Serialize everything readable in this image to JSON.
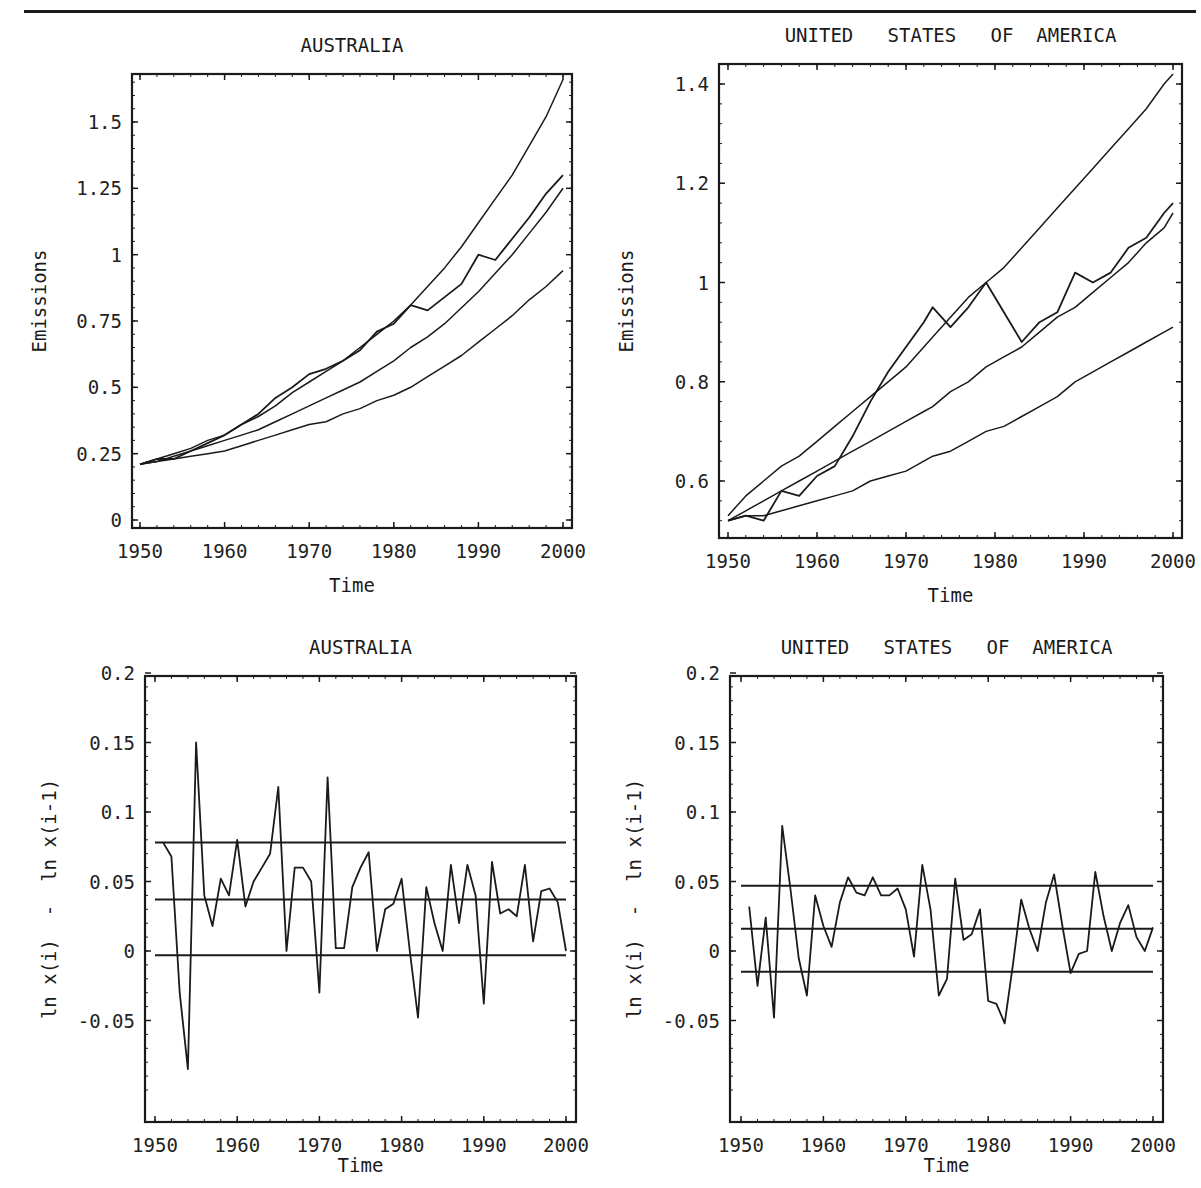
{
  "page": {
    "header_rule": true
  },
  "panels": [
    {
      "id": "aus-emissions",
      "title": "AUSTRALIA",
      "xlabel": "Time",
      "ylabel": "Emissions",
      "frame": {
        "left": 132,
        "top": 74,
        "right": 572,
        "bottom": 528
      },
      "xmap": {
        "x0": 1950,
        "px0": 140,
        "x1": 2000,
        "px1": 563
      },
      "ymap": {
        "y0": 0,
        "py0": 520,
        "y1": 1.5,
        "py1": 122
      },
      "yticks": [
        {
          "v": 0,
          "label": "0"
        },
        {
          "v": 0.25,
          "label": "0.25"
        },
        {
          "v": 0.5,
          "label": "0.5"
        },
        {
          "v": 0.75,
          "label": "0.75"
        },
        {
          "v": 1,
          "label": "1"
        },
        {
          "v": 1.25,
          "label": "1.25"
        },
        {
          "v": 1.5,
          "label": "1.5"
        }
      ],
      "xticks": [
        {
          "v": 1950,
          "label": "1950"
        },
        {
          "v": 1960,
          "label": "1960"
        },
        {
          "v": 1970,
          "label": "1970"
        },
        {
          "v": 1980,
          "label": "1980"
        },
        {
          "v": 1990,
          "label": "1990"
        },
        {
          "v": 2000,
          "label": "2000"
        }
      ]
    },
    {
      "id": "usa-emissions",
      "title": "UNITED   STATES   OF  AMERICA",
      "xlabel": "Time",
      "ylabel": "Emissions",
      "frame": {
        "left": 719,
        "top": 64,
        "right": 1182,
        "bottom": 538
      },
      "xmap": {
        "x0": 1950,
        "px0": 728,
        "x1": 2000,
        "px1": 1173
      },
      "ymap": {
        "y0": 0.6,
        "py0": 481,
        "y1": 1.4,
        "py1": 84
      },
      "yticks": [
        {
          "v": 0.6,
          "label": "0.6"
        },
        {
          "v": 0.8,
          "label": "0.8"
        },
        {
          "v": 1.0,
          "label": "1"
        },
        {
          "v": 1.2,
          "label": "1.2"
        },
        {
          "v": 1.4,
          "label": "1.4"
        }
      ],
      "xticks": [
        {
          "v": 1950,
          "label": "1950"
        },
        {
          "v": 1960,
          "label": "1960"
        },
        {
          "v": 1970,
          "label": "1970"
        },
        {
          "v": 1980,
          "label": "1980"
        },
        {
          "v": 1990,
          "label": "1990"
        },
        {
          "v": 2000,
          "label": "2000"
        }
      ]
    },
    {
      "id": "aus-growth",
      "title": "AUSTRALIA",
      "xlabel": "Time",
      "ylabel": "ln x(i)  -  ln x(i-1)",
      "frame": {
        "left": 145,
        "top": 676,
        "right": 576,
        "bottom": 1122
      },
      "xmap": {
        "x0": 1950,
        "px0": 155,
        "x1": 2000,
        "px1": 566
      },
      "ymap": {
        "y0": 0,
        "py0": 951,
        "y1": 0.2,
        "py1": 673
      },
      "yticks": [
        {
          "v": -0.05,
          "label": "-0.05"
        },
        {
          "v": 0,
          "label": "0"
        },
        {
          "v": 0.05,
          "label": "0.05"
        },
        {
          "v": 0.1,
          "label": "0.1"
        },
        {
          "v": 0.15,
          "label": "0.15"
        },
        {
          "v": 0.2,
          "label": "0.2"
        }
      ],
      "xticks": [
        {
          "v": 1950,
          "label": "1950"
        },
        {
          "v": 1960,
          "label": "1960"
        },
        {
          "v": 1970,
          "label": "1970"
        },
        {
          "v": 1980,
          "label": "1980"
        },
        {
          "v": 1990,
          "label": "1990"
        },
        {
          "v": 2000,
          "label": "2000"
        }
      ]
    },
    {
      "id": "usa-growth",
      "title": "UNITED   STATES   OF  AMERICA",
      "xlabel": "Time",
      "ylabel": "ln x(i)  -  ln x(i-1)",
      "frame": {
        "left": 730,
        "top": 676,
        "right": 1163,
        "bottom": 1122
      },
      "xmap": {
        "x0": 1950,
        "px0": 741,
        "x1": 2000,
        "px1": 1153
      },
      "ymap": {
        "y0": 0,
        "py0": 951,
        "y1": 0.2,
        "py1": 673
      },
      "yticks": [
        {
          "v": -0.05,
          "label": "-0.05"
        },
        {
          "v": 0,
          "label": "0"
        },
        {
          "v": 0.05,
          "label": "0.05"
        },
        {
          "v": 0.1,
          "label": "0.1"
        },
        {
          "v": 0.15,
          "label": "0.15"
        },
        {
          "v": 0.2,
          "label": "0.2"
        }
      ],
      "xticks": [
        {
          "v": 1950,
          "label": "1950"
        },
        {
          "v": 1960,
          "label": "1960"
        },
        {
          "v": 1970,
          "label": "1970"
        },
        {
          "v": 1980,
          "label": "1980"
        },
        {
          "v": 1990,
          "label": "1990"
        },
        {
          "v": 2000,
          "label": "2000"
        }
      ]
    }
  ],
  "chart_data": [
    {
      "type": "line",
      "title": "AUSTRALIA",
      "xlabel": "Time",
      "ylabel": "Emissions",
      "xlim": [
        1950,
        2000
      ],
      "ylim": [
        -0.02,
        1.7
      ],
      "grid": false,
      "legend": null,
      "x": [
        1950,
        1952,
        1954,
        1956,
        1958,
        1960,
        1962,
        1964,
        1966,
        1968,
        1970,
        1972,
        1974,
        1976,
        1978,
        1980,
        1982,
        1984,
        1986,
        1988,
        1990,
        1992,
        1994,
        1996,
        1998,
        2000
      ],
      "series": [
        {
          "name": "actual",
          "values": [
            0.21,
            0.23,
            0.23,
            0.26,
            0.29,
            0.32,
            0.36,
            0.4,
            0.46,
            0.5,
            0.55,
            0.57,
            0.6,
            0.64,
            0.71,
            0.74,
            0.81,
            0.79,
            0.84,
            0.89,
            1.0,
            0.98,
            1.06,
            1.14,
            1.23,
            1.3
          ]
        },
        {
          "name": "upper band",
          "values": [
            0.21,
            0.23,
            0.25,
            0.27,
            0.3,
            0.32,
            0.36,
            0.39,
            0.43,
            0.48,
            0.52,
            0.56,
            0.6,
            0.65,
            0.7,
            0.75,
            0.81,
            0.88,
            0.95,
            1.03,
            1.12,
            1.21,
            1.3,
            1.41,
            1.52,
            1.66
          ]
        },
        {
          "name": "trend",
          "values": [
            0.21,
            0.22,
            0.24,
            0.26,
            0.28,
            0.3,
            0.32,
            0.34,
            0.37,
            0.4,
            0.43,
            0.46,
            0.49,
            0.52,
            0.56,
            0.6,
            0.65,
            0.69,
            0.74,
            0.8,
            0.86,
            0.93,
            1.0,
            1.08,
            1.16,
            1.25
          ]
        },
        {
          "name": "lower band",
          "values": [
            0.21,
            0.22,
            0.23,
            0.24,
            0.25,
            0.26,
            0.28,
            0.3,
            0.32,
            0.34,
            0.36,
            0.37,
            0.4,
            0.42,
            0.45,
            0.47,
            0.5,
            0.54,
            0.58,
            0.62,
            0.67,
            0.72,
            0.77,
            0.83,
            0.88,
            0.94
          ]
        }
      ]
    },
    {
      "type": "line",
      "title": "UNITED STATES OF AMERICA",
      "xlabel": "Time",
      "ylabel": "Emissions",
      "xlim": [
        1950,
        2000
      ],
      "ylim": [
        0.5,
        1.43
      ],
      "grid": false,
      "legend": null,
      "x": [
        1950,
        1952,
        1954,
        1956,
        1958,
        1960,
        1962,
        1964,
        1966,
        1968,
        1970,
        1972,
        1973,
        1975,
        1977,
        1979,
        1981,
        1983,
        1985,
        1987,
        1989,
        1991,
        1993,
        1995,
        1997,
        1999,
        2000
      ],
      "series": [
        {
          "name": "actual",
          "values": [
            0.52,
            0.53,
            0.52,
            0.58,
            0.57,
            0.61,
            0.63,
            0.69,
            0.76,
            0.82,
            0.87,
            0.92,
            0.95,
            0.91,
            0.95,
            1.0,
            0.94,
            0.88,
            0.92,
            0.94,
            1.02,
            1.0,
            1.02,
            1.07,
            1.09,
            1.14,
            1.16
          ]
        },
        {
          "name": "upper band",
          "values": [
            0.53,
            0.57,
            0.6,
            0.63,
            0.65,
            0.68,
            0.71,
            0.74,
            0.77,
            0.8,
            0.83,
            0.87,
            0.89,
            0.93,
            0.97,
            1.0,
            1.03,
            1.07,
            1.11,
            1.15,
            1.19,
            1.23,
            1.27,
            1.31,
            1.35,
            1.4,
            1.42
          ]
        },
        {
          "name": "trend",
          "values": [
            0.52,
            0.54,
            0.56,
            0.58,
            0.6,
            0.62,
            0.64,
            0.66,
            0.68,
            0.7,
            0.72,
            0.74,
            0.75,
            0.78,
            0.8,
            0.83,
            0.85,
            0.87,
            0.9,
            0.93,
            0.95,
            0.98,
            1.01,
            1.04,
            1.08,
            1.11,
            1.14
          ]
        },
        {
          "name": "lower band",
          "values": [
            0.52,
            0.53,
            0.53,
            0.54,
            0.55,
            0.56,
            0.57,
            0.58,
            0.6,
            0.61,
            0.62,
            0.64,
            0.65,
            0.66,
            0.68,
            0.7,
            0.71,
            0.73,
            0.75,
            0.77,
            0.8,
            0.82,
            0.84,
            0.86,
            0.88,
            0.9,
            0.91
          ]
        }
      ]
    },
    {
      "type": "line",
      "title": "AUSTRALIA",
      "xlabel": "Time",
      "ylabel": "ln x(i) - ln x(i-1)",
      "xlim": [
        1950,
        2000
      ],
      "ylim": [
        -0.1,
        0.2
      ],
      "grid": false,
      "legend": null,
      "x": [
        1951,
        1952,
        1953,
        1954,
        1955,
        1956,
        1957,
        1958,
        1959,
        1960,
        1961,
        1962,
        1963,
        1964,
        1965,
        1966,
        1967,
        1968,
        1969,
        1970,
        1971,
        1972,
        1973,
        1974,
        1975,
        1976,
        1977,
        1978,
        1979,
        1980,
        1981,
        1982,
        1983,
        1984,
        1985,
        1986,
        1987,
        1988,
        1989,
        1990,
        1991,
        1992,
        1993,
        1994,
        1995,
        1996,
        1997,
        1998,
        1999,
        2000
      ],
      "series": [
        {
          "name": "growth rate",
          "values": [
            0.078,
            0.068,
            -0.03,
            -0.085,
            0.15,
            0.04,
            0.018,
            0.052,
            0.04,
            0.08,
            0.032,
            0.05,
            0.06,
            0.07,
            0.118,
            0.0,
            0.06,
            0.06,
            0.05,
            -0.03,
            0.125,
            0.002,
            0.002,
            0.046,
            0.06,
            0.071,
            0.0,
            0.03,
            0.034,
            0.052,
            0.0,
            -0.048,
            0.046,
            0.02,
            0.0,
            0.062,
            0.02,
            0.062,
            0.04,
            -0.038,
            0.064,
            0.027,
            0.03,
            0.025,
            0.062,
            0.007,
            0.043,
            0.045,
            0.035,
            0.0
          ]
        },
        {
          "name": "upper band",
          "values": [
            0.078,
            0.078
          ]
        },
        {
          "name": "mean",
          "values": [
            0.037,
            0.037
          ]
        },
        {
          "name": "lower band",
          "values": [
            -0.003,
            -0.003
          ]
        }
      ],
      "hlines": [
        0.078,
        0.037,
        -0.003
      ]
    },
    {
      "type": "line",
      "title": "UNITED STATES OF AMERICA",
      "xlabel": "Time",
      "ylabel": "ln x(i) - ln x(i-1)",
      "xlim": [
        1950,
        2000
      ],
      "ylim": [
        -0.1,
        0.2
      ],
      "grid": false,
      "legend": null,
      "x": [
        1951,
        1952,
        1953,
        1954,
        1955,
        1956,
        1957,
        1958,
        1959,
        1960,
        1961,
        1962,
        1963,
        1964,
        1965,
        1966,
        1967,
        1968,
        1969,
        1970,
        1971,
        1972,
        1973,
        1974,
        1975,
        1976,
        1977,
        1978,
        1979,
        1980,
        1981,
        1982,
        1983,
        1984,
        1985,
        1986,
        1987,
        1988,
        1989,
        1990,
        1991,
        1992,
        1993,
        1994,
        1995,
        1996,
        1997,
        1998,
        1999,
        2000
      ],
      "series": [
        {
          "name": "growth rate",
          "values": [
            0.032,
            -0.025,
            0.024,
            -0.048,
            0.09,
            0.045,
            -0.005,
            -0.032,
            0.04,
            0.018,
            0.003,
            0.035,
            0.053,
            0.042,
            0.04,
            0.053,
            0.04,
            0.04,
            0.045,
            0.03,
            -0.004,
            0.062,
            0.03,
            -0.032,
            -0.02,
            0.052,
            0.008,
            0.012,
            0.03,
            -0.036,
            -0.038,
            -0.052,
            -0.01,
            0.037,
            0.016,
            0.0,
            0.035,
            0.055,
            0.018,
            -0.016,
            -0.002,
            0.0,
            0.057,
            0.025,
            0.0,
            0.02,
            0.033,
            0.01,
            0.0,
            0.017
          ]
        },
        {
          "name": "upper band",
          "values": [
            0.047,
            0.047
          ]
        },
        {
          "name": "mean",
          "values": [
            0.016,
            0.016
          ]
        },
        {
          "name": "lower band",
          "values": [
            -0.015,
            -0.015
          ]
        }
      ],
      "hlines": [
        0.047,
        0.016,
        -0.015
      ]
    }
  ]
}
